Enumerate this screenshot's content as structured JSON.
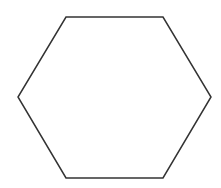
{
  "diagram": {
    "type": "polygon",
    "shape": "regular-hexagon",
    "orientation": "flat-top",
    "canvas": {
      "width": 221,
      "height": 188,
      "background": "#ffffff"
    },
    "stroke": {
      "color": "#333333",
      "width": 1.5
    },
    "fill": "none",
    "vertices": [
      {
        "x": 66,
        "y": 17
      },
      {
        "x": 163,
        "y": 17
      },
      {
        "x": 211,
        "y": 97
      },
      {
        "x": 163,
        "y": 178
      },
      {
        "x": 66,
        "y": 178
      },
      {
        "x": 18,
        "y": 97
      }
    ],
    "labels": []
  }
}
